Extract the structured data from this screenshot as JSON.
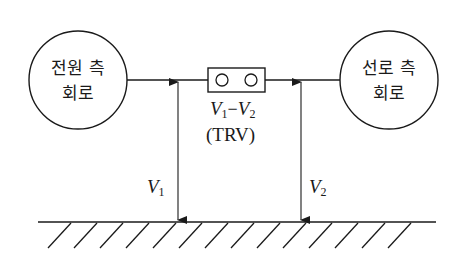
{
  "diagram": {
    "type": "circuit-schematic",
    "nodes": [
      {
        "id": "source-side-circuit",
        "shape": "circle",
        "label_line1": "전원 측",
        "label_line2": "회로"
      },
      {
        "id": "line-side-circuit",
        "shape": "circle",
        "label_line1": "선로 측",
        "label_line2": "회로"
      },
      {
        "id": "circuit-breaker",
        "shape": "rectangle-with-two-contacts",
        "label_expr": "V1−V2",
        "label_note": "(TRV)"
      }
    ],
    "voltages": {
      "v1": {
        "symbol": "V",
        "sub": "1"
      },
      "v2": {
        "symbol": "V",
        "sub": "2"
      },
      "diff": {
        "left_symbol": "V",
        "left_sub": "1",
        "op": "−",
        "right_symbol": "V",
        "right_sub": "2"
      },
      "trv": "(TRV)"
    },
    "ground": {
      "label": "ground",
      "hatch_count": 14
    },
    "colors": {
      "line": "#1a1a1a",
      "background": "#ffffff"
    }
  }
}
